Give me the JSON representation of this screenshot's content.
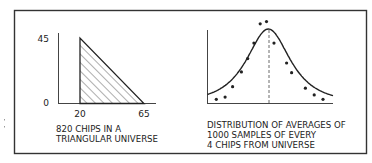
{
  "chart_data": [
    {
      "type": "area",
      "title": "",
      "caption": [
        "820 CHIPS IN A",
        "TRIANGULAR UNIVERSE"
      ],
      "xlabel": "",
      "ylabel": "",
      "x_ticks": [
        "20",
        "65"
      ],
      "y_ticks": [
        "0",
        "45"
      ],
      "xlim": [
        0,
        90
      ],
      "ylim": [
        0,
        45
      ],
      "shape": "right-triangle",
      "vertices": [
        [
          20,
          0
        ],
        [
          20,
          45
        ],
        [
          65,
          0
        ]
      ],
      "fill": "hatched",
      "total_chips": 820
    },
    {
      "type": "line",
      "title": "",
      "caption": [
        "DISTRIBUTION OF AVERAGES OF",
        "1000 SAMPLES OF EVERY",
        "4 CHIPS FROM UNIVERSE"
      ],
      "xlabel": "",
      "ylabel": "",
      "x_ticks": [],
      "y_ticks": [],
      "series": [
        {
          "name": "fitted-curve",
          "kind": "normal-like curve",
          "peak_rel_x": 0.5
        },
        {
          "name": "sample-points",
          "kind": "scatter",
          "points_rel": [
            [
              0.07,
              0.05
            ],
            [
              0.14,
              0.08
            ],
            [
              0.2,
              0.22
            ],
            [
              0.27,
              0.42
            ],
            [
              0.32,
              0.6
            ],
            [
              0.37,
              0.81
            ],
            [
              0.42,
              1.07
            ],
            [
              0.47,
              1.1
            ],
            [
              0.53,
              0.81
            ],
            [
              0.63,
              0.54
            ],
            [
              0.67,
              0.41
            ],
            [
              0.78,
              0.2
            ],
            [
              0.85,
              0.11
            ],
            [
              0.92,
              0.05
            ]
          ]
        }
      ],
      "mean_marker": "dashed vertical line at peak",
      "samples": 1000,
      "sample_size": 4
    }
  ],
  "colors": {
    "ink": "#222222",
    "frame": "#333333",
    "background": "#ffffff"
  }
}
